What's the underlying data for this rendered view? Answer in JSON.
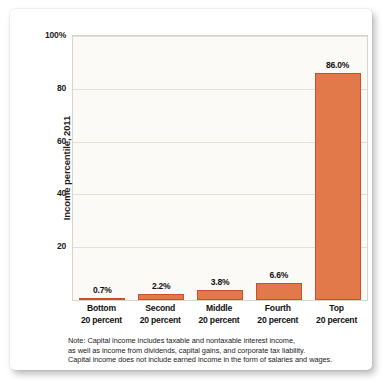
{
  "chart_data": {
    "type": "bar",
    "title": "",
    "xlabel": "",
    "ylabel": "Income percentile, 2011",
    "categories": [
      "Bottom 20 percent",
      "Second 20 percent",
      "Middle 20 percent",
      "Fourth 20 percent",
      "Top 20 percent"
    ],
    "category_lines": [
      [
        "Bottom",
        "20 percent"
      ],
      [
        "Second",
        "20 percent"
      ],
      [
        "Middle",
        "20 percent"
      ],
      [
        "Fourth",
        "20 percent"
      ],
      [
        "Top",
        "20 percent"
      ]
    ],
    "values": [
      0.7,
      2.2,
      3.8,
      6.6,
      86.0
    ],
    "value_labels": [
      "0.7%",
      "2.2%",
      "3.8%",
      "6.6%",
      "86.0%"
    ],
    "ylim": [
      0,
      100
    ],
    "yticks": [
      20,
      40,
      60,
      80,
      100
    ],
    "ytick_labels": [
      "20",
      "40",
      "60",
      "80",
      "100%"
    ],
    "grid": true,
    "legend": "none",
    "bar_color": "#E2794A",
    "bar_border_color": "#C8502A",
    "gridline_color": "#E3DFD2",
    "plot_background": "#FBFAF7"
  },
  "note": {
    "line1": "Note: Capital income includes taxable and nontaxable interest income,",
    "line2": "as well as income from dividends, capital gains, and corporate tax liability.",
    "line3": "Capital income does not include earned income in the form of salaries and wages."
  }
}
